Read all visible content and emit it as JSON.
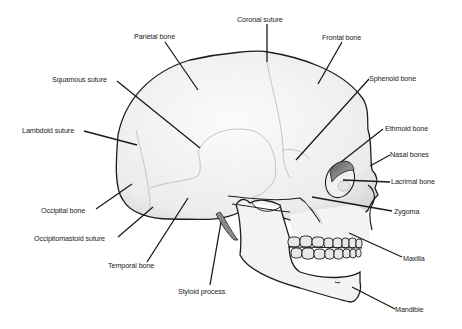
{
  "diagram": {
    "colors": {
      "bone_fill": "#f2f2f2",
      "outline": "#1e1e1e",
      "suture": "#c9c9c9",
      "leader": "#1a1a1a",
      "shadow": "#9a9a9a"
    },
    "labels": [
      {
        "id": "parietal-bone",
        "text": "Parietal bone"
      },
      {
        "id": "coronal-suture",
        "text": "Coronal suture"
      },
      {
        "id": "frontal-bone",
        "text": "Frontal bone"
      },
      {
        "id": "squamous-suture",
        "text": "Squamous suture"
      },
      {
        "id": "sphenoid-bone",
        "text": "Sphenoid bone"
      },
      {
        "id": "lambdoid-suture",
        "text": "Lambdoid suture"
      },
      {
        "id": "ethmoid-bone",
        "text": "Ethmoid bone"
      },
      {
        "id": "nasal-bones",
        "text": "Nasal bones"
      },
      {
        "id": "lacrimal-bone",
        "text": "Lacrimal bone"
      },
      {
        "id": "occipital-bone",
        "text": "Occipital bone"
      },
      {
        "id": "zygoma",
        "text": "Zygoma"
      },
      {
        "id": "occipitomastoid-suture",
        "text": "Occipitomastoid suture"
      },
      {
        "id": "maxilla",
        "text": "Maxilla"
      },
      {
        "id": "temporal-bone",
        "text": "Temporal bone"
      },
      {
        "id": "styloid-process",
        "text": "Styloid process"
      },
      {
        "id": "mandible",
        "text": "Mandible"
      }
    ]
  }
}
